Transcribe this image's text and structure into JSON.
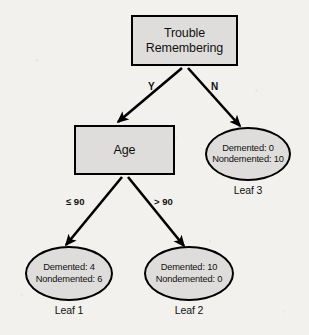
{
  "diagram": {
    "type": "decision-tree",
    "background_color": "#f2f1ee",
    "node_fill_color": "#dedddb",
    "node_border_color": "#000000",
    "text_color": "#111111"
  },
  "nodes": {
    "root": {
      "id": "root",
      "shape": "rectangle",
      "label_line1": "Trouble",
      "label_line2": "Remembering"
    },
    "age": {
      "id": "age",
      "shape": "rectangle",
      "label": "Age"
    },
    "leaf1": {
      "id": "leaf1",
      "shape": "ellipse",
      "line1": "Demented: 4",
      "line2": "Nondemented: 6",
      "caption": "Leaf 1",
      "demented": 4,
      "nondemented": 6
    },
    "leaf2": {
      "id": "leaf2",
      "shape": "ellipse",
      "line1": "Demented: 10",
      "line2": "Nondemented: 0",
      "caption": "Leaf 2",
      "demented": 10,
      "nondemented": 0
    },
    "leaf3": {
      "id": "leaf3",
      "shape": "ellipse",
      "line1": "Demented: 0",
      "line2": "Nondemented: 10",
      "caption": "Leaf 3",
      "demented": 0,
      "nondemented": 10
    }
  },
  "edges": [
    {
      "id": "root-yes",
      "from": "root",
      "to": "age",
      "label": "Y"
    },
    {
      "id": "root-no",
      "from": "root",
      "to": "leaf3",
      "label": "N"
    },
    {
      "id": "age-le90",
      "from": "age",
      "to": "leaf1",
      "label": "≤ 90"
    },
    {
      "id": "age-gt90",
      "from": "age",
      "to": "leaf2",
      "label": "> 90"
    }
  ]
}
